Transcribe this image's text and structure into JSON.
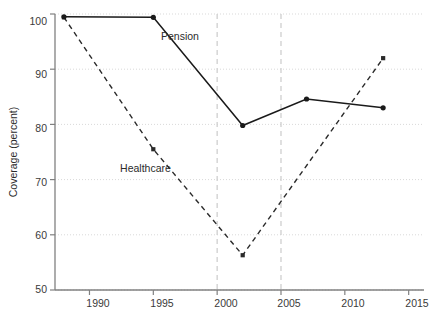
{
  "chart_data": {
    "type": "line",
    "title": "",
    "subtitle": "",
    "xlabel": "",
    "ylabel": "Coverage (percent)",
    "xlim": [
      1987,
      2016
    ],
    "ylim": [
      48,
      101
    ],
    "xticks": [
      1990,
      1995,
      2000,
      2005,
      2010,
      2015
    ],
    "xtick_labels": [
      "1990",
      "1995",
      "2000",
      "2005",
      "2010",
      "2015"
    ],
    "yticks": [
      50,
      60,
      70,
      80,
      90,
      100
    ],
    "ytick_labels": [
      "50",
      "60",
      "70",
      "80",
      "90",
      "100"
    ],
    "grid": "horizontal-dotted",
    "legend_position": "inline-annotations",
    "reference_lines": {
      "vertical": [
        2000,
        2005
      ],
      "style": "dashed",
      "color": "#cfcfcf"
    },
    "series": [
      {
        "name": "Pension",
        "style": "solid",
        "color": "#1a1a1a",
        "marker": "circle",
        "x": [
          1988,
          1995,
          2002,
          2007,
          2013
        ],
        "values": [
          99.5,
          99.4,
          79.8,
          84.6,
          83.0
        ]
      },
      {
        "name": "Healthcare",
        "style": "dashed",
        "color": "#2a2a2a",
        "marker": "small-square",
        "x": [
          1988,
          1995,
          2002,
          2013
        ],
        "values": [
          99.4,
          75.5,
          56.3,
          92.0
        ]
      }
    ],
    "annotations": [
      {
        "text": "Pension",
        "x": 1995.6,
        "y": 95.3
      },
      {
        "text": "Healthcare",
        "x": 1992.4,
        "y": 71.3
      }
    ]
  },
  "axes": {
    "y_axis_title": "Coverage (percent)",
    "x_tick_1": "1990",
    "x_tick_2": "1995",
    "x_tick_3": "2000",
    "x_tick_4": "2005",
    "x_tick_5": "2010",
    "x_tick_6": "2015",
    "y_tick_1": "50",
    "y_tick_2": "60",
    "y_tick_3": "70",
    "y_tick_4": "80",
    "y_tick_5": "90",
    "y_tick_6": "100"
  },
  "labels": {
    "pension": "Pension",
    "healthcare": "Healthcare"
  },
  "colors": {
    "background": "#ffffff",
    "axis": "#808080",
    "grid": "#d9d9d9",
    "reference_line": "#cfcfcf",
    "pension_line": "#1a1a1a",
    "healthcare_line": "#2a2a2a",
    "text": "#2b2b2b"
  }
}
